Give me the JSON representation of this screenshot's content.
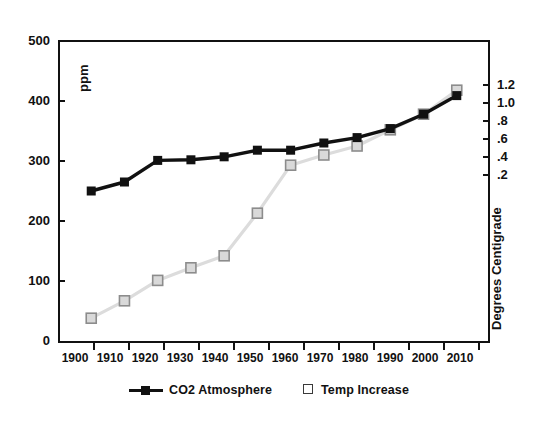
{
  "chart_data": {
    "type": "line",
    "title": "",
    "subtitle": "",
    "xlabel": "",
    "ylabel": "ppm",
    "y2label": "Degrees Centigrade",
    "grid": false,
    "legend_position": "bottom-center",
    "categories": [
      "1900",
      "1910",
      "1920",
      "1930",
      "1940",
      "1950",
      "1960",
      "1970",
      "1980",
      "1990",
      "2000",
      "2010"
    ],
    "x": [
      1900,
      1910,
      1920,
      1930,
      1940,
      1950,
      1960,
      1970,
      1980,
      1990,
      2000,
      2010
    ],
    "ylim": [
      0,
      500
    ],
    "yticks": [
      0,
      100,
      200,
      300,
      400,
      500
    ],
    "ytick_labels": [
      "0",
      "100",
      "200",
      "300",
      "400",
      "500"
    ],
    "y2lim": [
      0.2,
      1.2
    ],
    "y2ticks": [
      0.2,
      0.4,
      0.6,
      0.8,
      1.0,
      1.2
    ],
    "y2tick_labels": [
      ".2",
      ".4",
      ".6",
      ".8",
      "1.0",
      "1.2"
    ],
    "series": [
      {
        "name": "CO2 Atmosphere",
        "axis": "left",
        "units": "ppm",
        "color": "#111111",
        "marker": "filled-square",
        "values": [
          250,
          265,
          301,
          302,
          307,
          318,
          318,
          330,
          339,
          354,
          378,
          409
        ]
      },
      {
        "name": "Temp Increase",
        "axis": "right",
        "units": "Degrees Centigrade",
        "color": "#d0d0d0",
        "marker": "open-square",
        "values_left_scale": [
          38,
          67,
          101,
          122,
          142,
          213,
          293,
          310,
          325,
          352,
          378,
          418
        ],
        "values": [
          -1.52,
          -1.2,
          -0.82,
          -0.59,
          -0.37,
          0.42,
          1.31,
          1.5,
          1.67,
          1.97,
          2.26,
          2.7
        ]
      }
    ]
  },
  "legend": {
    "entries": [
      {
        "label": "CO2 Atmosphere",
        "marker": "filled-square-with-line"
      },
      {
        "label": "Temp Increase",
        "marker": "open-square"
      }
    ]
  },
  "axes": {
    "left_title": "ppm",
    "right_title": "Degrees Centigrade"
  },
  "colors": {
    "co2_line": "#111111",
    "co2_marker_fill": "#111111",
    "temp_line": "#dcdcdc",
    "temp_marker_fill": "#d9d9d9",
    "temp_marker_stroke": "#8c8c8c",
    "axis": "#111111",
    "background": "#ffffff"
  }
}
